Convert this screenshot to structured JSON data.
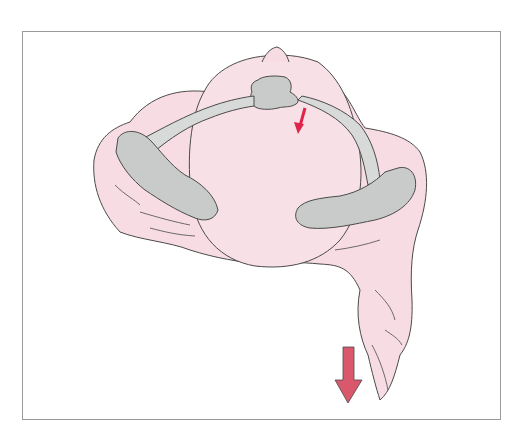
{
  "figure": {
    "type": "anatomical-illustration",
    "text_labels": [],
    "colors": {
      "soft_tissue": "#f7dde3",
      "bone": "#c9cbca",
      "bone_light": "#d8dad9",
      "outline": "#4a4a4a",
      "small_arrow": "#e0234a",
      "large_arrow": "#d9586c",
      "frame_border": "#9a9a9a"
    },
    "arrows": [
      {
        "name": "small-arrow",
        "direction": "down-left",
        "color": "#e0234a"
      },
      {
        "name": "large-arrow",
        "direction": "down",
        "color": "#d9586c"
      }
    ]
  }
}
